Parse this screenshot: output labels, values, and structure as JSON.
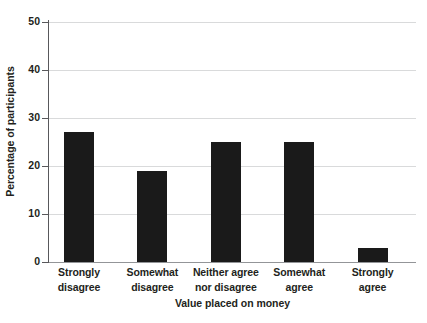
{
  "chart_data": {
    "type": "bar",
    "title": "",
    "xlabel": "Value placed on money",
    "ylabel": "Percentage of participants",
    "categories": [
      "Strongly disagree",
      "Somewhat disagree",
      "Neither agree nor disagree",
      "Somewhat agree",
      "Strongly agree"
    ],
    "category_lines": [
      [
        "Strongly",
        "disagree"
      ],
      [
        "Somewhat",
        "disagree"
      ],
      [
        "Neither agree",
        "nor disagree"
      ],
      [
        "Somewhat",
        "agree"
      ],
      [
        "Strongly",
        "agree"
      ]
    ],
    "values": [
      27,
      19,
      25,
      25,
      3
    ],
    "ylim": [
      0,
      50
    ],
    "yticks": [
      0,
      10,
      20,
      30,
      40,
      50
    ],
    "ytick_labels": [
      "0",
      "10",
      "20",
      "30",
      "40",
      "50"
    ],
    "grid": true,
    "legend": false,
    "colors": {
      "bar": "#1a1a1a",
      "gridline": "#d9dadb",
      "y_axis": "#58585b",
      "x_axis": "#939598",
      "text": "#231f20",
      "background": "#ffffff"
    }
  }
}
